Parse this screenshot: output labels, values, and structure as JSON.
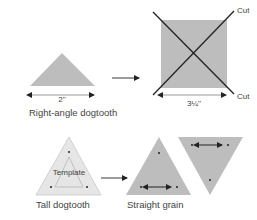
{
  "colors": {
    "shape_fill": "#bdbdbd",
    "template_fill": "#e6e6e6",
    "line": "#222222",
    "text": "#444444",
    "dim_line": "#9a9a9a"
  },
  "top_row": {
    "small_triangle": {
      "dimension_label": "2''",
      "caption": "Right-angle dogtooth"
    },
    "square": {
      "dimension_label": "3¼''",
      "cut_label_top": "Cut",
      "cut_label_bottom": "Cut"
    }
  },
  "bottom_row": {
    "template_triangle": {
      "template_label": "Template",
      "caption": "Tall dogtooth"
    },
    "cut_triangles": {
      "caption": "Straight grain"
    }
  }
}
